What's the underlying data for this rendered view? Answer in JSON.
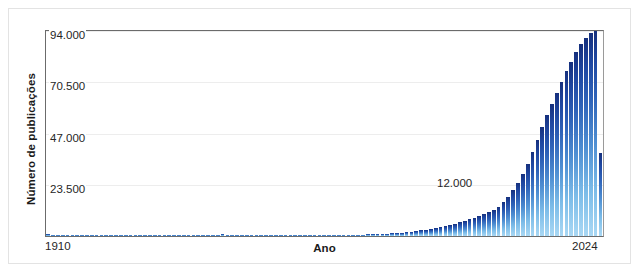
{
  "chart_data": {
    "type": "bar",
    "title": "",
    "xlabel": "Ano",
    "ylabel": "Número de publicações",
    "grid": true,
    "legend": "none",
    "xlim": [
      1910,
      2024
    ],
    "ylim": [
      0,
      94000
    ],
    "ytick_labels": [
      "94.000",
      "70.500",
      "47.000",
      "23.500"
    ],
    "ytick_values": [
      94000,
      70500,
      47000,
      23500
    ],
    "xtick_labels": [
      "1910",
      "2024"
    ],
    "annotations": [
      {
        "text": "12.000",
        "value": 12000,
        "near_year": 2000
      }
    ],
    "bar_color_top": "#16307d",
    "bar_color_bottom": "#a9d8f4",
    "categories": [
      1910,
      1911,
      1912,
      1913,
      1914,
      1915,
      1916,
      1917,
      1918,
      1919,
      1920,
      1921,
      1922,
      1923,
      1924,
      1925,
      1926,
      1927,
      1928,
      1929,
      1930,
      1931,
      1932,
      1933,
      1934,
      1935,
      1936,
      1937,
      1938,
      1939,
      1940,
      1941,
      1942,
      1943,
      1944,
      1945,
      1946,
      1947,
      1948,
      1949,
      1950,
      1951,
      1952,
      1953,
      1954,
      1955,
      1956,
      1957,
      1958,
      1959,
      1960,
      1961,
      1962,
      1963,
      1964,
      1965,
      1966,
      1967,
      1968,
      1969,
      1970,
      1971,
      1972,
      1973,
      1974,
      1975,
      1976,
      1977,
      1978,
      1979,
      1980,
      1981,
      1982,
      1983,
      1984,
      1985,
      1986,
      1987,
      1988,
      1989,
      1990,
      1991,
      1992,
      1993,
      1994,
      1995,
      1996,
      1997,
      1998,
      1999,
      2000,
      2001,
      2002,
      2003,
      2004,
      2005,
      2006,
      2007,
      2008,
      2009,
      2010,
      2011,
      2012,
      2013,
      2014,
      2015,
      2016,
      2017,
      2018,
      2019,
      2020,
      2021,
      2022,
      2023,
      2024
    ],
    "values": [
      900,
      120,
      100,
      90,
      80,
      80,
      70,
      70,
      70,
      70,
      90,
      90,
      90,
      90,
      90,
      100,
      100,
      100,
      100,
      110,
      110,
      110,
      110,
      110,
      110,
      120,
      120,
      120,
      120,
      120,
      120,
      120,
      120,
      130,
      130,
      130,
      900,
      130,
      130,
      140,
      140,
      140,
      150,
      150,
      150,
      160,
      160,
      170,
      170,
      180,
      190,
      200,
      210,
      230,
      240,
      260,
      280,
      300,
      320,
      350,
      380,
      420,
      460,
      500,
      560,
      620,
      700,
      780,
      880,
      980,
      1100,
      1250,
      1400,
      1600,
      1800,
      2050,
      2300,
      2600,
      2950,
      3300,
      3700,
      4150,
      4600,
      5100,
      5650,
      6250,
      6900,
      7600,
      8350,
      9150,
      10000,
      11000,
      12000,
      13500,
      15500,
      18000,
      21000,
      24500,
      28500,
      33000,
      38500,
      44000,
      50000,
      55500,
      60500,
      65500,
      70500,
      75500,
      80000,
      84500,
      88000,
      91000,
      93000,
      94000,
      38000
    ]
  }
}
